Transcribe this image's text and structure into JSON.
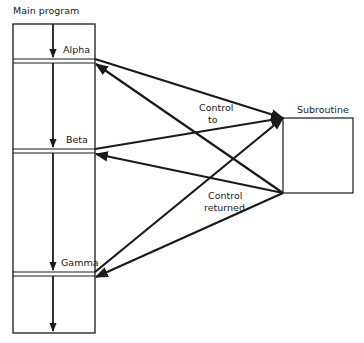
{
  "diagram": {
    "main_program": {
      "title": "Main program",
      "call_points": [
        {
          "label": "Alpha"
        },
        {
          "label": "Beta"
        },
        {
          "label": "Gamma"
        }
      ]
    },
    "subroutine": {
      "title": "Subroutine"
    },
    "annotations": {
      "control_to_line1": "Control",
      "control_to_line2": "to",
      "control_returned_line1": "Control",
      "control_returned_line2": "returned"
    },
    "colors": {
      "line": "#1a1a1a",
      "background": "#ffffff"
    }
  }
}
